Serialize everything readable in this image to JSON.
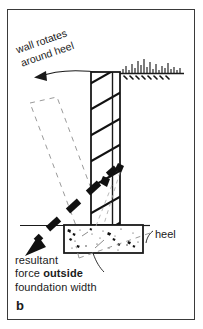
{
  "figure": {
    "panel_label": "b",
    "annotations": {
      "rotation_note_line1": "wall rotates",
      "rotation_note_line2": "around heel",
      "heel_label": "heel",
      "resultant_line1": "resultant",
      "resultant_line2_prefix": "force ",
      "resultant_line2_emphasis": "outside",
      "resultant_line3": "foundation width"
    },
    "colors": {
      "ink": "#1a1a1a",
      "frame": "#3a3a3a",
      "hatch": "#111111",
      "dashed_ghost": "#8c8c8c",
      "paper": "#ffffff"
    },
    "geometry": {
      "frame": {
        "x": 7,
        "y": 9,
        "width": 188,
        "height": 311
      },
      "wall": {
        "x": 91,
        "y": 72,
        "width": 29,
        "height": 153
      },
      "footing": {
        "x": 64,
        "y": 225,
        "width": 79,
        "height": 28
      },
      "ground_line_y": 73,
      "force_arrow_from": [
        118,
        167
      ],
      "force_arrow_to": [
        29,
        249
      ],
      "rotation_arc_arrow_tip": [
        35,
        76
      ]
    }
  }
}
